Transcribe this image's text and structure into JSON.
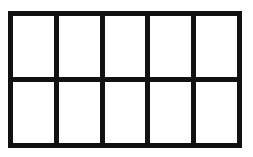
{
  "diagram": {
    "type": "ten-frame",
    "rows": 2,
    "columns": 5,
    "line_color": "#111111",
    "cell_color": "#ffffff",
    "cells": [
      {
        "row": 1,
        "col": 1,
        "filled": false
      },
      {
        "row": 1,
        "col": 2,
        "filled": false
      },
      {
        "row": 1,
        "col": 3,
        "filled": false
      },
      {
        "row": 1,
        "col": 4,
        "filled": false
      },
      {
        "row": 1,
        "col": 5,
        "filled": false
      },
      {
        "row": 2,
        "col": 1,
        "filled": false
      },
      {
        "row": 2,
        "col": 2,
        "filled": false
      },
      {
        "row": 2,
        "col": 3,
        "filled": false
      },
      {
        "row": 2,
        "col": 4,
        "filled": false
      },
      {
        "row": 2,
        "col": 5,
        "filled": false
      }
    ]
  }
}
